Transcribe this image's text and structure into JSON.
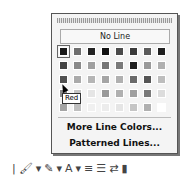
{
  "popup": {
    "no_line_label": "No Line",
    "more_colors_label": "More Line Colors...",
    "patterned_label": "Patterned Lines...",
    "tooltip": "Red",
    "swatches": [
      [
        "#1a1a1a",
        "#6e6e6e",
        "#222222",
        "#111111",
        "#4a4a4a",
        "#3a3a3a",
        "#5a5a5a",
        "#1e1e1e"
      ],
      [
        "#444444",
        "#8a8a8a",
        "#a0a0a0",
        "#777777",
        "#7a7a7a",
        "#1f1f1f",
        "#9a9a9a",
        "#b0b0b0"
      ],
      [
        "#505050",
        "#aaaaaa",
        "#b5b5b5",
        "#a5a5a5",
        "#b0b0b0",
        "#6a6a6a",
        "#555555",
        "#bdbdbd"
      ],
      [
        "#888888",
        "#c5c5c5",
        "#e5e5e5",
        "#9a9a9a",
        "#b0b0b0",
        "#a0a0a0",
        "#7a7a7a",
        "#dcdcdc"
      ],
      [
        "#a5a5a5",
        "#bfbfbf",
        "#f0f0f0",
        "#ececec",
        "#e5e5e5",
        "#c5c5c5",
        "#b0b0b0",
        "#ffffff"
      ]
    ]
  },
  "toolbar": {
    "items": [
      "|",
      "🖌",
      "▾",
      "✎",
      "▾",
      "A",
      "▾",
      "≡",
      "☰",
      "⇄",
      "▮"
    ]
  }
}
